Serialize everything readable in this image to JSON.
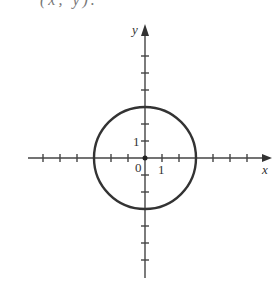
{
  "header_fragment": "(x, y).",
  "chart_data": {
    "type": "line",
    "title": "",
    "xlabel": "x",
    "ylabel": "y",
    "xlim": [
      -6,
      6
    ],
    "ylim": [
      -6,
      6
    ],
    "origin_label": "0",
    "tick_labels": {
      "x": [
        "1"
      ],
      "y": [
        "1"
      ]
    },
    "grid": false,
    "legend": null,
    "series": [
      {
        "name": "circle",
        "center": [
          0,
          0
        ],
        "radius": 3,
        "points": [
          [
            3,
            0
          ],
          [
            0,
            3
          ],
          [
            -3,
            0
          ],
          [
            0,
            -3
          ]
        ]
      }
    ]
  },
  "colors": {
    "stroke": "#333333",
    "axis": "#444444"
  }
}
